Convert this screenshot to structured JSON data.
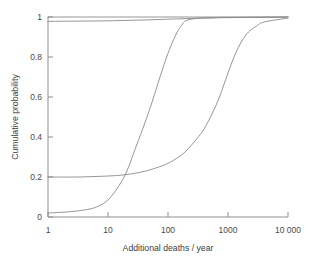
{
  "chart_data": {
    "type": "line",
    "title": "",
    "xlabel": "Additional deaths / year",
    "ylabel": "Cumulative probability",
    "xscale": "log",
    "xlim": [
      1,
      10000
    ],
    "ylim": [
      0,
      1
    ],
    "grid": false,
    "legend": null,
    "xticks": [
      1,
      10,
      100,
      1000,
      10000
    ],
    "xtick_labels": [
      "1",
      "10",
      "100",
      "1000",
      "10 000"
    ],
    "yticks": [
      0,
      0.2,
      0.4,
      0.6,
      0.8,
      1
    ],
    "ytick_labels": [
      "0",
      "0.2",
      "0.4",
      "0.6",
      "0.8",
      "1"
    ],
    "line_color": "#8a8a8a",
    "axis_color": "#8f8f8f",
    "series": [
      {
        "name": "upper-plateau-curve",
        "comment": "near-saturated curve, starts just below 1 and converges to 1",
        "x": [
          1,
          2,
          5,
          10,
          20,
          50,
          100,
          200,
          500,
          1000,
          2000,
          4000,
          10000
        ],
        "values": [
          0.978,
          0.979,
          0.98,
          0.981,
          0.983,
          0.986,
          0.989,
          0.992,
          0.995,
          0.997,
          0.998,
          0.999,
          1.0
        ]
      },
      {
        "name": "ceiling-line",
        "comment": "flat reference line at probability 1",
        "x": [
          1,
          10000
        ],
        "values": [
          1.0,
          1.0
        ]
      },
      {
        "name": "steep-sigmoid-curve",
        "comment": "rises from 0.02 at x=1, midpoint near 60, reaches 1 by 200",
        "x": [
          1,
          2,
          3,
          5,
          7,
          10,
          14,
          20,
          30,
          40,
          55,
          70,
          90,
          110,
          140,
          170,
          200,
          300,
          600,
          1000,
          4000,
          10000
        ],
        "values": [
          0.02,
          0.025,
          0.03,
          0.04,
          0.055,
          0.085,
          0.14,
          0.22,
          0.36,
          0.46,
          0.58,
          0.68,
          0.78,
          0.85,
          0.92,
          0.96,
          0.982,
          0.993,
          0.997,
          0.998,
          0.999,
          1.0
        ]
      },
      {
        "name": "shallow-sigmoid-curve",
        "comment": "starts at 0.2 plateau, slowly rises, midpoint near 700, reaches ~0.98 by 4000",
        "x": [
          1,
          3,
          10,
          20,
          40,
          70,
          100,
          150,
          200,
          300,
          400,
          550,
          700,
          850,
          1000,
          1300,
          1700,
          2200,
          3000,
          4000,
          10000
        ],
        "values": [
          0.2,
          0.2,
          0.205,
          0.212,
          0.228,
          0.25,
          0.268,
          0.3,
          0.33,
          0.39,
          0.44,
          0.52,
          0.59,
          0.66,
          0.72,
          0.81,
          0.88,
          0.925,
          0.955,
          0.975,
          0.995
        ]
      }
    ]
  },
  "axes": {
    "x_title": "Additional deaths / year",
    "y_title": "Cumulative probability"
  }
}
